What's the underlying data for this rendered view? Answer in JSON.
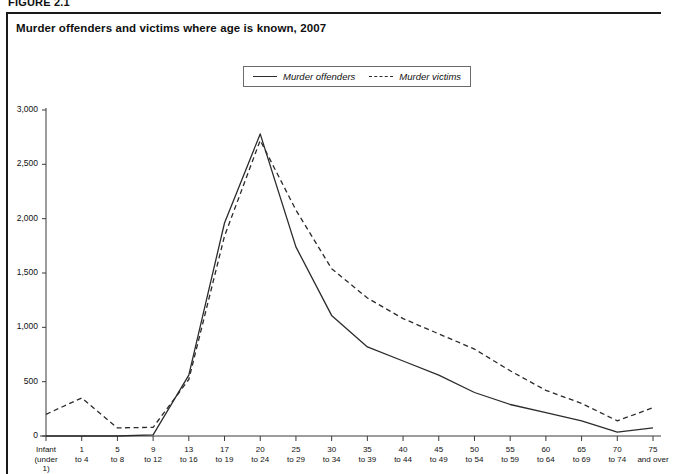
{
  "figure": {
    "label": "FIGURE 2.1",
    "title": "Murder offenders and victims where age is known, 2007"
  },
  "legend": {
    "entries": [
      {
        "label": "Murder offenders",
        "style": "solid"
      },
      {
        "label": "Murder victims",
        "style": "dashed"
      }
    ]
  },
  "chart_data": {
    "type": "line",
    "title": "Murder offenders and victims where age is known, 2007",
    "xlabel": "",
    "ylabel": "",
    "ylim": [
      0,
      3000
    ],
    "yticks": [
      0,
      500,
      1000,
      1500,
      2000,
      2500,
      3000
    ],
    "ytick_labels": [
      "0",
      "500",
      "1,000",
      "1,500",
      "2,000",
      "2,500",
      "3,000"
    ],
    "grid": false,
    "legend_position": "top-center",
    "categories": [
      "Infant (under 1)",
      "1 to 4",
      "5 to 8",
      "9 to 12",
      "13 to 16",
      "17 to 19",
      "20 to 24",
      "25 to 29",
      "30 to 34",
      "35 to 39",
      "40 to 44",
      "45 to 49",
      "50 to 54",
      "55 to 59",
      "60 to 64",
      "65 to 69",
      "70 to 74",
      "75 and over"
    ],
    "series": [
      {
        "name": "Murder offenders",
        "style": "solid",
        "color": "#2b2b2b",
        "values": [
          0,
          0,
          0,
          10,
          560,
          1960,
          2780,
          1740,
          1110,
          820,
          690,
          560,
          400,
          290,
          215,
          140,
          35,
          75
        ]
      },
      {
        "name": "Murder victims",
        "style": "dashed",
        "color": "#2b2b2b",
        "values": [
          200,
          350,
          75,
          80,
          520,
          1840,
          2720,
          2080,
          1540,
          1270,
          1080,
          940,
          800,
          600,
          420,
          300,
          140,
          260
        ]
      }
    ]
  },
  "colors": {
    "frame": "#1a1a1a",
    "axis": "#3a3a3a",
    "line": "#2b2b2b",
    "text": "#111111",
    "background": "#ffffff"
  }
}
